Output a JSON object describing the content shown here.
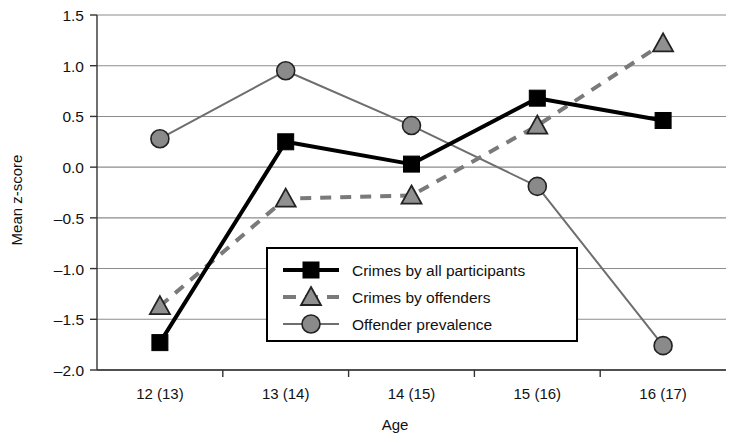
{
  "chart_data": {
    "type": "line",
    "title": "",
    "xlabel": "Age",
    "ylabel": "Mean z-score",
    "categories": [
      "12 (13)",
      "13 (14)",
      "14 (15)",
      "15 (16)",
      "16 (17)"
    ],
    "ylim": [
      -2.0,
      1.5
    ],
    "yticks": [
      "1.5",
      "1.0",
      "0.5",
      "0.0",
      "-0.5",
      "-1.0",
      "-1.5",
      "-2.0"
    ],
    "ytick_values": [
      1.5,
      1.0,
      0.5,
      0.0,
      -0.5,
      -1.0,
      -1.5,
      -2.0
    ],
    "grid": true,
    "legend_position": "center-bottom-inside",
    "series": [
      {
        "name": "Crimes by all participants",
        "marker": "square",
        "line_style": "solid",
        "color": "#000000",
        "line_width": 4,
        "values": [
          -1.73,
          0.25,
          0.03,
          0.68,
          0.46
        ]
      },
      {
        "name": "Crimes by offenders",
        "marker": "triangle",
        "line_style": "dashed",
        "color": "#7a7a7a",
        "line_width": 4,
        "values": [
          -1.37,
          -0.31,
          -0.28,
          0.41,
          1.22
        ]
      },
      {
        "name": "Offender prevalence",
        "marker": "circle",
        "line_style": "solid",
        "color": "#6e6e6e",
        "line_width": 2,
        "values": [
          0.28,
          0.95,
          0.41,
          -0.19,
          -1.76
        ]
      }
    ]
  },
  "legend": {
    "items": [
      {
        "label": "Crimes by all participants",
        "marker": "square-marker"
      },
      {
        "label": "Crimes by offenders",
        "marker": "triangle-marker"
      },
      {
        "label": "Offender prevalence",
        "marker": "circle-marker"
      }
    ]
  },
  "axes": {
    "y_title": "Mean z-score",
    "x_title": "Age"
  }
}
